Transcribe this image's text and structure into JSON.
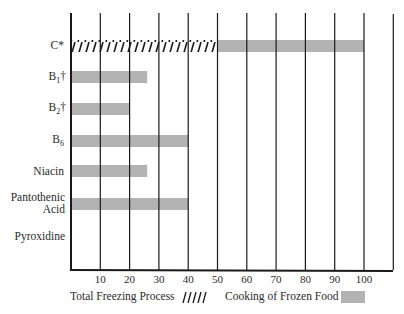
{
  "chart_data": {
    "type": "bar",
    "orientation": "horizontal",
    "title": "",
    "xlabel": "",
    "ylabel": "",
    "xlim": [
      0,
      110
    ],
    "x_ticks": [
      "10",
      "20",
      "30",
      "40",
      "50",
      "60",
      "70",
      "80",
      "90",
      "100"
    ],
    "categories": [
      "C*",
      "B1†",
      "B2†",
      "B6",
      "Niacin",
      "Pantothenic Acid",
      "Pyroxidine"
    ],
    "series": [
      {
        "name": "Total Freezing Process",
        "pattern": "hatched",
        "values": [
          50,
          0,
          0,
          0,
          0,
          0,
          0
        ]
      },
      {
        "name": "Cooking of Frozen Food",
        "pattern": "solid-gray",
        "values": [
          50,
          26,
          20,
          40,
          26,
          40,
          0
        ]
      }
    ],
    "cumulative_totals": [
      100,
      26,
      20,
      40,
      26,
      40,
      0
    ],
    "grid": true,
    "legend_position": "bottom"
  },
  "labels": {
    "c": "C*",
    "b1_main": "B",
    "b1_sub": "1",
    "b1_mark": "†",
    "b2_main": "B",
    "b2_sub": "2",
    "b2_mark": "†",
    "b6_main": "B",
    "b6_sub": "6",
    "niacin": "Niacin",
    "panto1": "Pantothenic",
    "panto2": "Acid",
    "pyro": "Pyroxidine"
  },
  "ticks": [
    "10",
    "20",
    "30",
    "40",
    "50",
    "60",
    "70",
    "80",
    "90",
    "100"
  ],
  "legend": {
    "freezing": "Total Freezing Process",
    "cooking": "Cooking of Frozen Food"
  },
  "colors": {
    "bar": "#b3b3b3",
    "line": "#1a1a1a"
  }
}
